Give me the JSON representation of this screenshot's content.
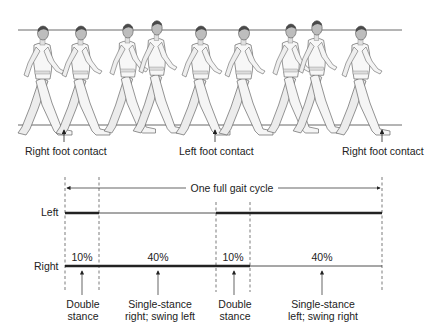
{
  "figure": {
    "top_panel": {
      "description": "Sequence of nine walking figures between a head line and a ground line",
      "figure_count": 9,
      "contact_labels": [
        {
          "label": "Right foot contact",
          "x": 64
        },
        {
          "label": "Left foot contact",
          "x": 215
        },
        {
          "label": "Right foot contact",
          "x": 382
        }
      ]
    },
    "bottom_panel": {
      "cycle_label": "One full gait cycle",
      "rows": [
        {
          "label": "Left"
        },
        {
          "label": "Right"
        }
      ],
      "percentages": [
        "10%",
        "40%",
        "10%",
        "40%"
      ],
      "phases": [
        {
          "line1": "Double",
          "line2": "stance"
        },
        {
          "line1": "Single-stance",
          "line2": "right; swing left"
        },
        {
          "line1": "Double",
          "line2": "stance"
        },
        {
          "line1": "Single-stance",
          "line2": "left; swing right"
        }
      ]
    }
  },
  "colors": {
    "ink": "#222222",
    "figure_fill": "#f2f2f2",
    "figure_shade": "#9a9a9a",
    "figure_hair": "#4a4a4a"
  }
}
